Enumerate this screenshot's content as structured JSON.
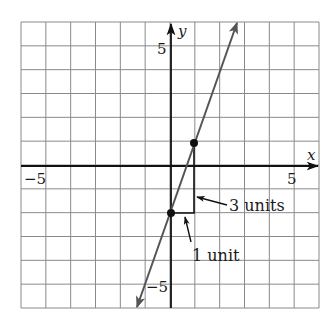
{
  "chart_data": {
    "type": "line",
    "title": "",
    "xlabel": "x",
    "ylabel": "y",
    "xlim": [
      -6,
      6
    ],
    "ylim": [
      -6,
      6
    ],
    "grid": true,
    "x_ticks_labeled": [
      {
        "value": -5,
        "label": "−5"
      },
      {
        "value": 5,
        "label": "5"
      }
    ],
    "y_ticks_labeled": [
      {
        "value": 5,
        "label": "5"
      },
      {
        "value": -5,
        "label": "−5"
      }
    ],
    "series": [
      {
        "name": "line y = 3x - 2",
        "slope": 3,
        "intercept": -2,
        "x_range": [
          -1.35,
          2.67
        ],
        "arrows_both_ends": true
      }
    ],
    "points": [
      {
        "x": 0,
        "y": -2
      },
      {
        "x": 1,
        "y": 1
      }
    ],
    "slope_triangle": {
      "run": {
        "from": [
          0,
          -2
        ],
        "to": [
          1,
          -2
        ],
        "label": "1 unit"
      },
      "rise": {
        "from": [
          1,
          -2
        ],
        "to": [
          1,
          1
        ],
        "label": "3 units"
      }
    },
    "annotations": [
      {
        "text": "3 units",
        "points_to": "rise"
      },
      {
        "text": "1 unit",
        "points_to": "run"
      }
    ],
    "colors": {
      "grid": "#8a8a8a",
      "axes": "#111111",
      "line": "#555555",
      "points": "#111111"
    }
  },
  "labels": {
    "x_axis": "x",
    "y_axis": "y",
    "x_neg5": "−5",
    "x_pos5": "5",
    "y_pos5": "5",
    "y_neg5": "−5",
    "rise": "3 units",
    "run": "1 unit"
  }
}
